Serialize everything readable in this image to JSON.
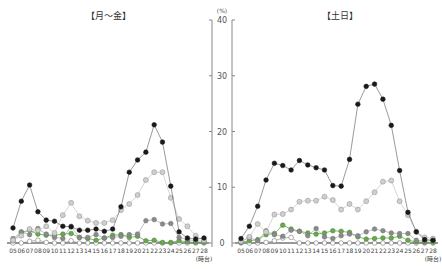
{
  "chart_data": [
    {
      "type": "line",
      "title": "【月～金】",
      "xlabel": "(時台)",
      "ylabel": "(%)",
      "ylim": [
        0,
        40
      ],
      "yticks": [
        0,
        10,
        20,
        30,
        40
      ],
      "categories": [
        "05",
        "06",
        "07",
        "08",
        "09",
        "10",
        "11",
        "12",
        "13",
        "14",
        "15",
        "16",
        "17",
        "18",
        "19",
        "20",
        "21",
        "22",
        "23",
        "24",
        "25",
        "26",
        "27",
        "28"
      ],
      "series": [
        {
          "name": "series-black",
          "style": "black",
          "values": [
            2.7,
            7.5,
            10.4,
            5.6,
            4.1,
            3.9,
            3.0,
            2.9,
            2.3,
            2.3,
            2.5,
            2.1,
            2.5,
            6.5,
            12.7,
            14.9,
            16.3,
            21.2,
            18.1,
            10.2,
            2.0,
            0.9,
            0.7,
            0.9
          ]
        },
        {
          "name": "series-lightgray",
          "style": "lightgray",
          "values": [
            0.5,
            1.3,
            2.5,
            2.3,
            3.0,
            1.8,
            5.0,
            7.2,
            4.8,
            4.0,
            3.6,
            3.6,
            4.1,
            5.9,
            7.0,
            8.6,
            11.3,
            12.7,
            12.7,
            8.1,
            4.3,
            3.0,
            1.3,
            0.5
          ]
        },
        {
          "name": "series-gray",
          "style": "gray",
          "values": [
            0.8,
            2.0,
            1.5,
            2.6,
            1.6,
            1.0,
            0.8,
            3.0,
            1.0,
            1.0,
            1.5,
            0.9,
            1.0,
            1.2,
            1.5,
            1.6,
            4.0,
            4.2,
            3.4,
            3.5,
            1.0,
            0.6,
            0.4,
            0.3
          ]
        },
        {
          "name": "series-green",
          "style": "green",
          "values": [
            0.4,
            1.9,
            2.3,
            1.6,
            1.4,
            1.4,
            1.6,
            1.7,
            1.0,
            0.8,
            0.5,
            0.9,
            1.4,
            1.5,
            1.0,
            1.2,
            0.4,
            0.5,
            0.1,
            0.1,
            0.4,
            0.2,
            0.1,
            0.1
          ]
        },
        {
          "name": "series-white",
          "style": "white",
          "values": [
            0,
            0,
            0.3,
            0.5,
            0.1,
            0,
            0,
            0.4,
            0,
            0,
            0,
            0,
            0,
            0,
            0,
            0,
            0,
            0,
            0,
            0,
            0,
            0,
            0,
            0
          ]
        }
      ]
    },
    {
      "type": "line",
      "title": "【土日】",
      "xlabel": "(時台)",
      "ylabel": "(%)",
      "ylim": [
        0,
        40
      ],
      "yticks": [
        0,
        10,
        20,
        30,
        40
      ],
      "categories": [
        "05",
        "06",
        "07",
        "08",
        "09",
        "10",
        "11",
        "12",
        "13",
        "14",
        "15",
        "16",
        "17",
        "18",
        "19",
        "20",
        "21",
        "22",
        "23",
        "24",
        "25",
        "26",
        "27",
        "28"
      ],
      "series": [
        {
          "name": "series-black",
          "style": "black",
          "values": [
            0.8,
            3.0,
            6.6,
            11.3,
            14.3,
            13.9,
            13.1,
            14.8,
            14.0,
            13.5,
            13.1,
            10.3,
            10.2,
            15.0,
            24.9,
            28.1,
            28.5,
            25.8,
            21.1,
            13.0,
            5.5,
            2.0,
            0.6,
            0.5
          ]
        },
        {
          "name": "series-lightgray",
          "style": "lightgray",
          "values": [
            0.3,
            1.1,
            3.4,
            2.0,
            5.1,
            5.2,
            6.0,
            7.4,
            7.6,
            7.6,
            8.3,
            7.7,
            6.0,
            7.0,
            6.0,
            7.5,
            9.1,
            11.0,
            11.2,
            7.5,
            5.0,
            2.0,
            1.0,
            0.8
          ]
        },
        {
          "name": "series-gray",
          "style": "gray",
          "values": [
            0.2,
            1.0,
            0.4,
            2.2,
            1.5,
            1.2,
            2.3,
            2.1,
            1.3,
            2.6,
            1.1,
            0.8,
            1.3,
            1.6,
            1.3,
            2.0,
            2.5,
            2.2,
            1.8,
            1.7,
            1.7,
            0.5,
            0.3,
            0.5
          ]
        },
        {
          "name": "series-green",
          "style": "green",
          "values": [
            0.1,
            0.4,
            0.6,
            1.5,
            1.7,
            3.2,
            2.5,
            2.1,
            1.8,
            1.6,
            1.8,
            2.2,
            2.1,
            1.9,
            1.1,
            0.7,
            0.8,
            0.9,
            0.9,
            1.2,
            0.5,
            0.2,
            0.1,
            0.1
          ]
        },
        {
          "name": "series-white",
          "style": "white",
          "values": [
            0,
            0,
            0,
            0.1,
            0.4,
            0.9,
            1.0,
            0,
            0,
            0,
            0,
            0,
            0,
            0,
            0,
            0,
            0,
            0,
            0,
            0,
            0,
            0,
            0,
            0
          ]
        }
      ]
    }
  ],
  "colors": {
    "black": "#1a1a1a",
    "lightgray": "#b8b8b8",
    "gray": "#8a8a8a",
    "green": "#6aa84f",
    "white": "#ffffff",
    "axis": "#888888",
    "baseline": "#333333"
  }
}
